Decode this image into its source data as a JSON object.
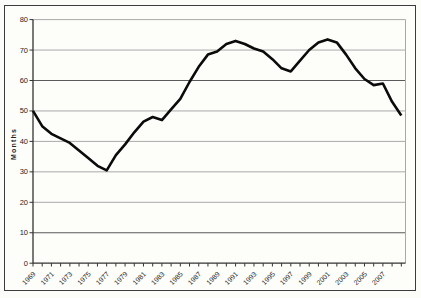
{
  "chart_data": {
    "type": "line",
    "title": "",
    "xlabel": "",
    "ylabel": "Months",
    "x": [
      1969,
      1970,
      1971,
      1972,
      1973,
      1974,
      1975,
      1976,
      1977,
      1978,
      1979,
      1980,
      1981,
      1982,
      1983,
      1984,
      1985,
      1986,
      1987,
      1988,
      1989,
      1990,
      1991,
      1992,
      1993,
      1994,
      1995,
      1996,
      1997,
      1998,
      1999,
      2000,
      2001,
      2002,
      2003,
      2004,
      2005,
      2006,
      2007,
      2008,
      2009
    ],
    "values": [
      50,
      45,
      42.5,
      41,
      39.5,
      37,
      34.5,
      32,
      30.5,
      35.5,
      39,
      43,
      46.5,
      48,
      47,
      50.5,
      54,
      59.5,
      64.5,
      68.5,
      69.5,
      72,
      73,
      72,
      70.5,
      69.5,
      67,
      64,
      63,
      66.5,
      70,
      72.5,
      73.5,
      72.5,
      68.5,
      64,
      60.5,
      58.5,
      59,
      53,
      48.5
    ],
    "ylim": [
      0,
      80
    ],
    "y_ticks": [
      0,
      10,
      20,
      30,
      40,
      50,
      60,
      70,
      80
    ],
    "x_tick_labels": [
      "1969",
      "1971",
      "1973",
      "1975",
      "1977",
      "1979",
      "1981",
      "1983",
      "1985",
      "1987",
      "1989",
      "1991",
      "1993",
      "1995",
      "1997",
      "1999",
      "2001",
      "2003",
      "2005",
      "2007"
    ],
    "grid": "horizontal",
    "legend_position": "none",
    "colors": {
      "line": "#0b0b0b",
      "gridline": "#a9a9a9",
      "emphasized_gridline": "#5a5a5a",
      "axis": "#333333",
      "label": "#1d1d1d",
      "chart_border": "#3c3c3c",
      "background": "#fcfcf9"
    },
    "emphasized_gridlines": [
      10,
      60
    ]
  }
}
